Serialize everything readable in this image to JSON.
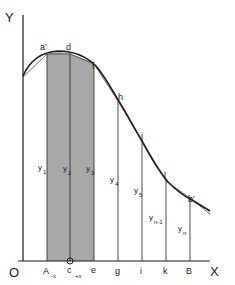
{
  "diagram": {
    "type": "area-under-curve-ordinates",
    "axes": {
      "y_label": "Y",
      "x_label": "X",
      "origin_label": "O"
    },
    "curve_points": [
      "a'",
      "d",
      "f",
      "h",
      "j",
      "l",
      "b'"
    ],
    "x_labels": [
      "A",
      "-x",
      "c",
      "+x",
      "e",
      "g",
      "i",
      "k",
      "B"
    ],
    "ordinates": [
      {
        "base": "y",
        "sub": "1"
      },
      {
        "base": "y",
        "sub": "2"
      },
      {
        "base": "y",
        "sub": "3"
      },
      {
        "base": "y",
        "sub": "4"
      },
      {
        "base": "y",
        "sub": "5"
      },
      {
        "base": "y",
        "sub": "n-1"
      },
      {
        "base": "y",
        "sub": "n"
      }
    ],
    "shaded_strip": {
      "from": "A",
      "to": "e",
      "center": "c",
      "color": "#a8a8a8"
    },
    "colors": {
      "line": "#1a1a1a",
      "shade": "#a8a8a8",
      "background": "#ffffff"
    }
  },
  "labels": {
    "Y": "Y",
    "X": "X",
    "O": "O",
    "a_prime": "a'",
    "d": "d",
    "f": "f",
    "h": "h",
    "j": "j",
    "l": "l",
    "b_prime": "b'",
    "A": "A",
    "minus_x": "-x",
    "c": "c",
    "plus_x": "+x",
    "e": "e",
    "g": "g",
    "i": "i",
    "k": "k",
    "B": "B",
    "y": "y",
    "s1": "1",
    "s2": "2",
    "s3": "3",
    "s4": "4",
    "s5": "5",
    "sn1": "n-1",
    "sn": "n"
  }
}
